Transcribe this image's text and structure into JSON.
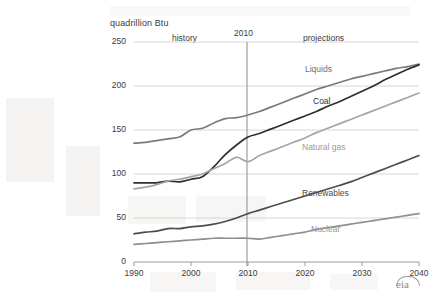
{
  "chart_data": {
    "type": "line",
    "title": "",
    "ylabel": "quadrillion Btu",
    "xlabel": "",
    "xlim": [
      1990,
      2040
    ],
    "ylim": [
      0,
      250
    ],
    "yticks": [
      0,
      50,
      100,
      150,
      200,
      250
    ],
    "xticks": [
      1990,
      2000,
      2010,
      2020,
      2030,
      2040
    ],
    "grid": "horizontal",
    "legend": "inline-labels",
    "annotations": {
      "history": "history",
      "divider_year": "2010",
      "projections": "projections",
      "divider_x": 2010
    },
    "logo": "eia",
    "x": [
      1990,
      1992,
      1994,
      1996,
      1998,
      2000,
      2002,
      2004,
      2006,
      2008,
      2010,
      2012,
      2014,
      2016,
      2018,
      2020,
      2022,
      2024,
      2026,
      2028,
      2030,
      2032,
      2034,
      2036,
      2038,
      2040
    ],
    "series": [
      {
        "name": "Liquids",
        "color": "#7a7a7a",
        "values": [
          135,
          136,
          138,
          140,
          142,
          150,
          152,
          158,
          163,
          164,
          167,
          171,
          176,
          181,
          186,
          191,
          196,
          200,
          204,
          208,
          211,
          214,
          217,
          220,
          222,
          225
        ]
      },
      {
        "name": "Coal",
        "color": "#2f2f2f",
        "values": [
          90,
          90,
          90,
          92,
          91,
          94,
          97,
          108,
          122,
          133,
          142,
          146,
          151,
          156,
          161,
          166,
          171,
          177,
          182,
          188,
          194,
          200,
          207,
          213,
          219,
          224
        ]
      },
      {
        "name": "Natural gas",
        "color": "#a5a5a5",
        "values": [
          83,
          85,
          88,
          92,
          94,
          97,
          100,
          106,
          112,
          119,
          114,
          121,
          126,
          131,
          136,
          141,
          147,
          152,
          157,
          162,
          167,
          172,
          177,
          182,
          187,
          192
        ]
      },
      {
        "name": "Renewables",
        "color": "#4d4d4d",
        "values": [
          32,
          34,
          35,
          38,
          38,
          40,
          41,
          43,
          46,
          50,
          55,
          59,
          63,
          67,
          71,
          75,
          79,
          83,
          87,
          91,
          96,
          101,
          106,
          111,
          116,
          121
        ]
      },
      {
        "name": "Nuclear",
        "color": "#8f8f8f",
        "values": [
          20,
          21,
          22,
          23,
          24,
          25,
          26,
          27,
          27,
          27,
          27,
          26,
          28,
          30,
          32,
          34,
          37,
          39,
          41,
          43,
          45,
          47,
          49,
          51,
          53,
          55
        ]
      }
    ]
  },
  "axis": {
    "y_title": "quadrillion  Btu",
    "yticks": [
      "250",
      "200",
      "150",
      "100",
      "50",
      "0"
    ],
    "xticks": [
      "1990",
      "2000",
      "2010",
      "2020",
      "2030",
      "2040"
    ]
  },
  "labels": {
    "history": "history",
    "divider_year": "2010",
    "projections": "projections",
    "liquids": "Liquids",
    "coal": "Coal",
    "natural_gas": "Natural gas",
    "renewables": "Renewables",
    "nuclear": "Nuclear"
  },
  "branding": {
    "logo_text": "eia"
  }
}
